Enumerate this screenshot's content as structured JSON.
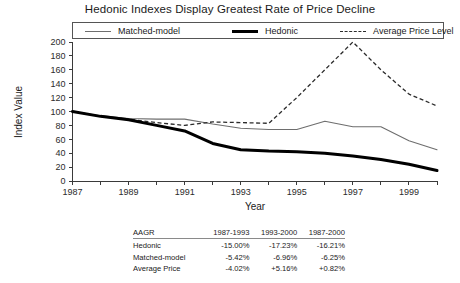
{
  "chart_data": {
    "type": "line",
    "title": "Hedonic Indexes Display Greatest Rate of Price Decline",
    "xlabel": "Year",
    "ylabel": "Index Value",
    "xlim": [
      1987,
      2000
    ],
    "ylim": [
      0,
      200
    ],
    "grid": false,
    "legend_position": "top",
    "x": [
      1987,
      1988,
      1989,
      1990,
      1991,
      1992,
      1993,
      1994,
      1995,
      1996,
      1997,
      1998,
      1999,
      2000
    ],
    "x_tick_labels": [
      "1987",
      "1989",
      "1991",
      "1993",
      "1995",
      "1997",
      "1999"
    ],
    "x_ticks": [
      1987,
      1989,
      1991,
      1993,
      1995,
      1997,
      1999
    ],
    "y_ticks": [
      0,
      20,
      40,
      60,
      80,
      100,
      120,
      140,
      160,
      180,
      200
    ],
    "y_tick_labels": [
      "0",
      "20",
      "40",
      "60",
      "80",
      "100",
      "120",
      "140",
      "160",
      "180",
      "200"
    ],
    "series": [
      {
        "name": "Matched-model",
        "style": "thin-solid",
        "color": "#6e6e6e",
        "values": [
          100,
          94,
          90,
          89,
          89,
          82,
          76,
          74,
          74,
          86,
          78,
          78,
          58,
          45
        ]
      },
      {
        "name": "Hedonic",
        "style": "thick-solid",
        "color": "#000000",
        "values": [
          100,
          93,
          88,
          80,
          72,
          54,
          45,
          43,
          42,
          40,
          36,
          31,
          24,
          15
        ]
      },
      {
        "name": "Average Price Level",
        "style": "dashed",
        "color": "#2b2b2b",
        "values": [
          100,
          93,
          89,
          84,
          80,
          85,
          84,
          83,
          120,
          160,
          200,
          160,
          125,
          108
        ]
      }
    ]
  },
  "legend": {
    "items": [
      {
        "label": "Matched-model",
        "swatch": "thin-solid-line-icon"
      },
      {
        "label": "Hedonic",
        "swatch": "thick-solid-line-icon"
      },
      {
        "label": "Average Price Level",
        "swatch": "dashed-line-icon"
      }
    ]
  },
  "table": {
    "headers": [
      "AAGR",
      "1987-1993",
      "1993-2000",
      "1987-2000"
    ],
    "rows": [
      {
        "label": "Hedonic",
        "cells": [
          "-15.00%",
          "-17.23%",
          "-16.21%"
        ]
      },
      {
        "label": "Matched-model",
        "cells": [
          "-5.42%",
          "-6.96%",
          "-6.25%"
        ]
      },
      {
        "label": "Average Price",
        "cells": [
          "-4.02%",
          "+5.16%",
          "+0.82%"
        ]
      }
    ]
  }
}
